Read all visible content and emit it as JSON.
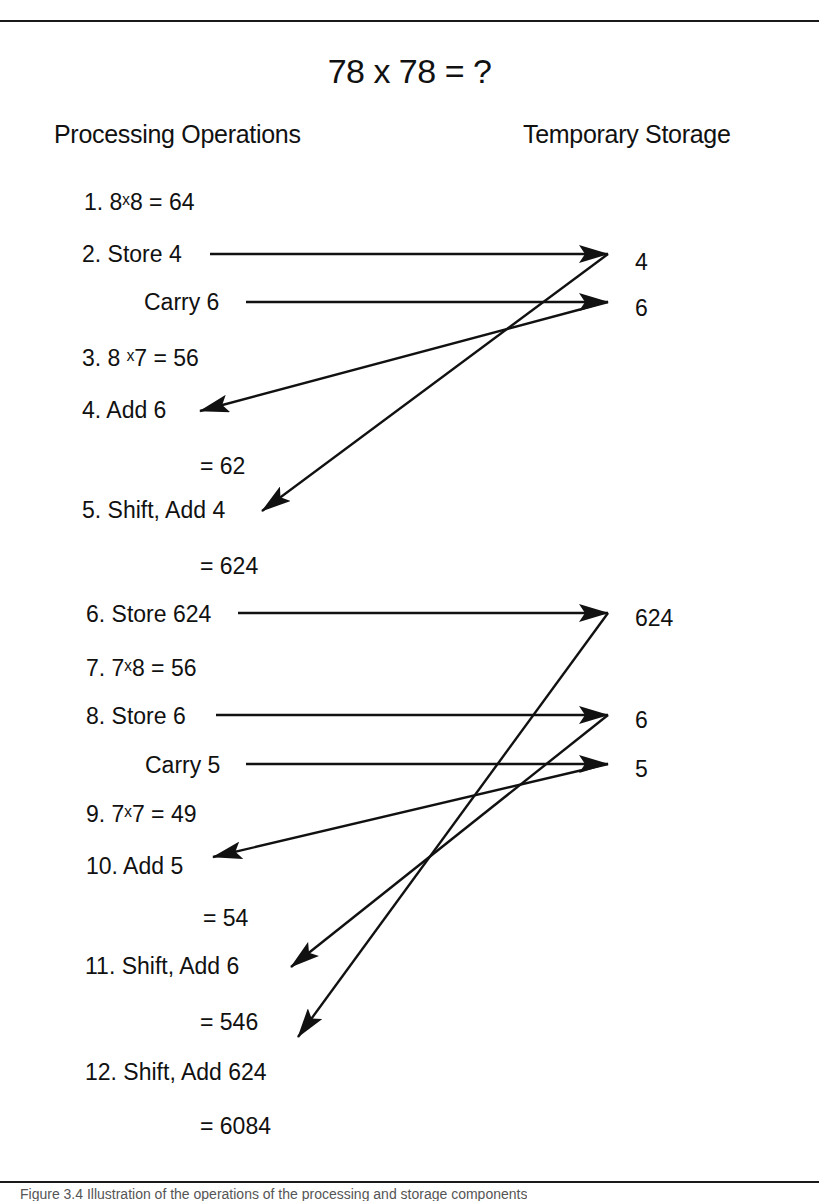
{
  "title": "78 x 78 = ?",
  "columns": {
    "left_heading": "Processing Operations",
    "right_heading": "Temporary Storage"
  },
  "operations": [
    {
      "id": "op1",
      "text": "1. 8ˣ8 = 64"
    },
    {
      "id": "op2",
      "text": "2. Store 4"
    },
    {
      "id": "op2b",
      "text": "Carry 6"
    },
    {
      "id": "op3",
      "text": "3. 8 ˣ7 = 56"
    },
    {
      "id": "op4",
      "text": "4. Add 6"
    },
    {
      "id": "op4r",
      "text": "= 62"
    },
    {
      "id": "op5",
      "text": "5. Shift, Add 4"
    },
    {
      "id": "op5r",
      "text": "= 624"
    },
    {
      "id": "op6",
      "text": "6. Store 624"
    },
    {
      "id": "op7",
      "text": "7. 7ˣ8 = 56"
    },
    {
      "id": "op8",
      "text": "8. Store 6"
    },
    {
      "id": "op8b",
      "text": "Carry 5"
    },
    {
      "id": "op9",
      "text": "9. 7ˣ7 = 49"
    },
    {
      "id": "op10",
      "text": "10. Add 5"
    },
    {
      "id": "op10r",
      "text": "= 54"
    },
    {
      "id": "op11",
      "text": "11. Shift, Add 6"
    },
    {
      "id": "op11r",
      "text": "= 546"
    },
    {
      "id": "op12",
      "text": "12. Shift, Add 624"
    },
    {
      "id": "op12r",
      "text": "= 6084"
    }
  ],
  "storage": [
    {
      "id": "s1",
      "text": "4"
    },
    {
      "id": "s2",
      "text": "6"
    },
    {
      "id": "s3",
      "text": "624"
    },
    {
      "id": "s4",
      "text": "6"
    },
    {
      "id": "s5",
      "text": "5"
    }
  ],
  "arrows": [
    {
      "from": "Store 4",
      "to": "4 (storage)"
    },
    {
      "from": "Carry 6",
      "to": "6 (storage)"
    },
    {
      "from": "6 (storage)",
      "to": "Add 6"
    },
    {
      "from": "4 (storage)",
      "to": "Shift, Add 4"
    },
    {
      "from": "Store 624",
      "to": "624 (storage)"
    },
    {
      "from": "Store 6",
      "to": "6 (storage)"
    },
    {
      "from": "Carry 5",
      "to": "5 (storage)"
    },
    {
      "from": "5 (storage)",
      "to": "Add 5"
    },
    {
      "from": "6 (storage)",
      "to": "Shift, Add 6"
    },
    {
      "from": "624 (storage)",
      "to": "Shift, Add 624"
    }
  ],
  "caption": "Figure 3.4   Illustration of the operations of the processing and storage components"
}
